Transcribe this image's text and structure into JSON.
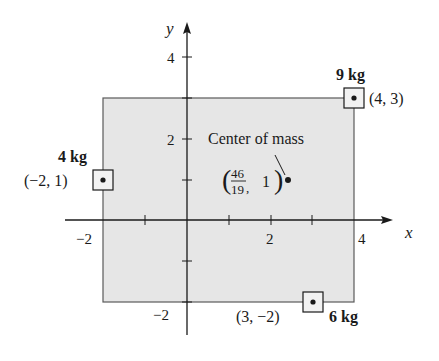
{
  "figure": {
    "axes": {
      "x_label": "x",
      "y_label": "y",
      "x_ticks": [
        {
          "value": -2,
          "label": "−2"
        },
        {
          "value": 2,
          "label": "2"
        },
        {
          "value": 4,
          "label": "4"
        }
      ],
      "y_ticks": [
        {
          "value": 4,
          "label": "4"
        },
        {
          "value": 2,
          "label": "2"
        },
        {
          "value": -2,
          "label": "−2"
        }
      ],
      "x_range": [
        -2.9,
        5
      ],
      "y_range": [
        -2.8,
        5
      ]
    },
    "region": {
      "description": "Shaded rectangle",
      "x_min": -2,
      "x_max": 4,
      "y_min": -2,
      "y_max": 3,
      "fill": "#e6e6e6",
      "stroke": "#5a5a5a"
    },
    "masses": [
      {
        "mass_label": "4 kg",
        "coord_label": "(−2, 1)",
        "x": -2,
        "y": 1
      },
      {
        "mass_label": "9 kg",
        "coord_label": "(4, 3)",
        "x": 4,
        "y": 3
      },
      {
        "mass_label": "6 kg",
        "coord_label": "(3, −2)",
        "x": 3,
        "y": -2
      }
    ],
    "center_of_mass": {
      "label": "Center of mass",
      "numerator": "46",
      "denominator": "19",
      "y_value": "1",
      "x": 2.42,
      "y": 1
    }
  }
}
